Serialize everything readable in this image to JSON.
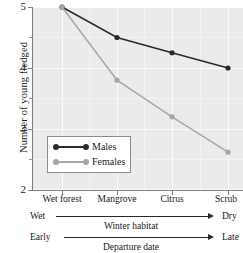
{
  "chart_data": {
    "type": "line",
    "title": "",
    "xlabel": "Winter habitat",
    "ylabel": "Number of young fledged",
    "categories": [
      "Wet forest",
      "Mangrove",
      "Citrus",
      "Scrub"
    ],
    "series": [
      {
        "name": "Males",
        "values": [
          5.0,
          4.5,
          4.25,
          4.0
        ],
        "color": "#2a2a2a"
      },
      {
        "name": "Females",
        "values": [
          5.0,
          3.8,
          3.2,
          2.62
        ],
        "color": "#a6a6a6"
      }
    ],
    "ylim": [
      2,
      5
    ],
    "yticks": [
      2,
      3,
      4,
      5
    ],
    "ytick_labels": [
      "2",
      "3",
      "4",
      "5"
    ],
    "yminor_ticks": [
      2.5,
      3.5,
      4.5
    ],
    "grid": true,
    "grid_color": "#fbfbfb",
    "panel_color": "#ebebeb",
    "legend": {
      "position": "lower-left",
      "entries": [
        "Males",
        "Females"
      ]
    },
    "annotations": [
      {
        "name": "winter-habitat-gradient",
        "left_label": "Wet",
        "right_label": "Dry",
        "caption": "Winter habitat"
      },
      {
        "name": "departure-date-gradient",
        "left_label": "Early",
        "right_label": "Late",
        "caption": "Departure date"
      }
    ]
  },
  "axis": {
    "y_title": "Number of young fledged",
    "y_labels": [
      "5",
      "4",
      "3",
      "2"
    ],
    "x_labels": [
      "Wet forest",
      "Mangrove",
      "Citrus",
      "Scrub"
    ]
  },
  "legend": {
    "males": "Males",
    "females": "Females"
  },
  "annotations": {
    "habitat": {
      "left": "Wet",
      "right": "Dry",
      "caption": "Winter habitat"
    },
    "departure": {
      "left": "Early",
      "right": "Late",
      "caption": "Departure date"
    }
  }
}
